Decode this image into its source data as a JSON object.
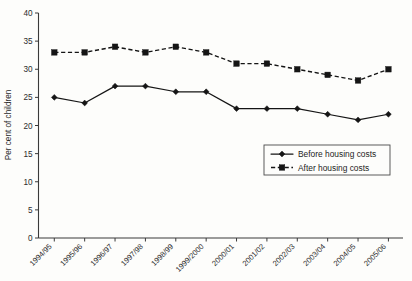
{
  "chart_data": {
    "type": "line",
    "title": "",
    "xlabel": "",
    "ylabel": "Per cent of children",
    "ylim": [
      0,
      40
    ],
    "ytick_step": 5,
    "yticks": [
      "0",
      "5",
      "10",
      "15",
      "20",
      "25",
      "30",
      "35",
      "40"
    ],
    "grid": false,
    "legend_position": "lower-right-inside",
    "categories": [
      "1994/95",
      "1995/96",
      "1996/97",
      "1997/98",
      "1998/99",
      "1999/2000",
      "2000/01",
      "2001/02",
      "2002/03",
      "2003/04",
      "2004/05",
      "2005/06"
    ],
    "series": [
      {
        "name": "Before housing costs",
        "marker": "diamond",
        "linestyle": "solid",
        "color": "#151515",
        "values": [
          25,
          24,
          27,
          27,
          26,
          26,
          23,
          23,
          23,
          22,
          21,
          22
        ]
      },
      {
        "name": "After housing costs",
        "marker": "square",
        "linestyle": "dashed",
        "color": "#151515",
        "values": [
          33,
          33,
          34,
          33,
          34,
          33,
          31,
          31,
          30,
          29,
          28,
          30
        ]
      }
    ]
  },
  "legend": {
    "items": [
      {
        "label": "Before housing costs",
        "marker": "diamond",
        "linestyle": "solid"
      },
      {
        "label": "After housing costs",
        "marker": "square",
        "linestyle": "dashed"
      }
    ]
  },
  "colors": {
    "ink": "#151515",
    "axis": "#3a3a3a",
    "background": "#fdfdfb"
  }
}
